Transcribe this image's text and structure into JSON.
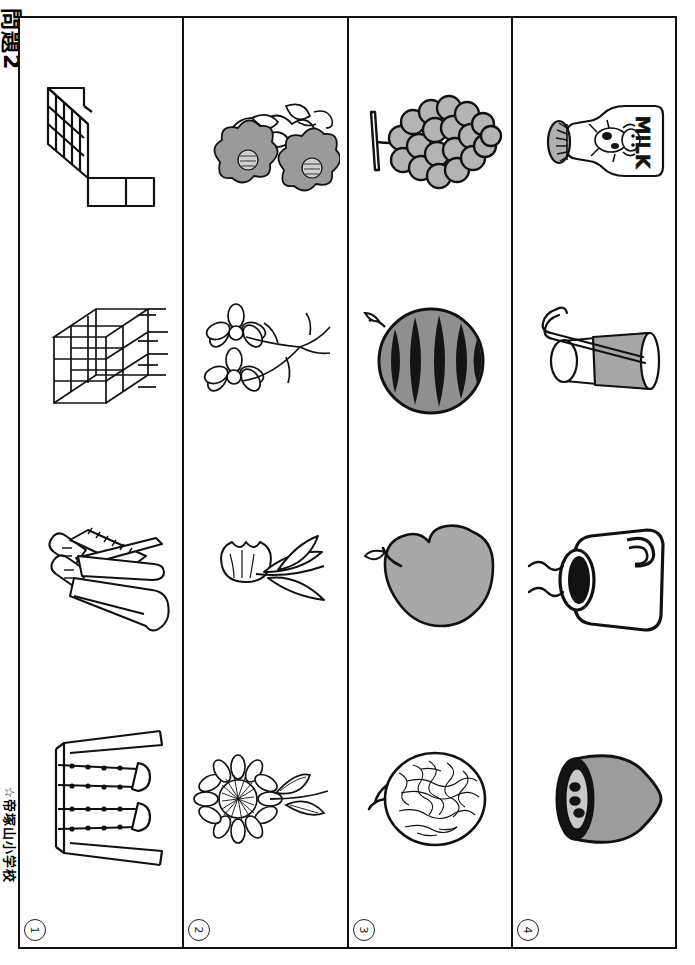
{
  "sheet": {
    "title": "問題2",
    "school": "☆帝塚山小学校",
    "orientation": "landscape-worksheet-rotated-90",
    "ink_color": "#111111",
    "fill_gray": "#9a9a9a",
    "paper_color": "#ffffff"
  },
  "columns": [
    {
      "number": "1",
      "number_glyph": "①",
      "theme": "playground-equipment",
      "items": [
        {
          "name": "stairs-slide-frame",
          "label": "すべり台の階段",
          "icon": "stairs-icon"
        },
        {
          "name": "jungle-gym",
          "label": "ジャングルジム",
          "icon": "jungle-gym-icon"
        },
        {
          "name": "slide",
          "label": "すべり台",
          "icon": "slide-icon"
        },
        {
          "name": "swing-set",
          "label": "ブランコ",
          "icon": "swing-icon"
        }
      ]
    },
    {
      "number": "2",
      "number_glyph": "②",
      "theme": "flowers",
      "items": [
        {
          "name": "camellia-flowers",
          "label": "つばき",
          "icon": "camellia-icon"
        },
        {
          "name": "cosmos-flowers",
          "label": "コスモス",
          "icon": "daisy-icon"
        },
        {
          "name": "tulip-flower",
          "label": "チューリップ",
          "icon": "tulip-icon"
        },
        {
          "name": "sunflower",
          "label": "ひまわり",
          "icon": "sunflower-icon"
        }
      ]
    },
    {
      "number": "3",
      "number_glyph": "③",
      "theme": "fruits",
      "items": [
        {
          "name": "grapes",
          "label": "ぶどう",
          "icon": "grapes-icon"
        },
        {
          "name": "watermelon",
          "label": "すいか",
          "icon": "watermelon-icon"
        },
        {
          "name": "apple",
          "label": "りんご",
          "icon": "apple-icon"
        },
        {
          "name": "melon",
          "label": "メロン",
          "icon": "melon-icon"
        }
      ]
    },
    {
      "number": "4",
      "number_glyph": "④",
      "theme": "drinks",
      "items": [
        {
          "name": "milk-bottle",
          "label": "ぎゅうにゅう",
          "icon": "milk-bottle-icon",
          "text_on_bottle": "MILK"
        },
        {
          "name": "juice-glass",
          "label": "ジュース",
          "icon": "glass-straw-icon"
        },
        {
          "name": "coffee-cup",
          "label": "コーヒー",
          "icon": "mug-icon"
        },
        {
          "name": "soup-bowl",
          "label": "スープ",
          "icon": "bowl-icon"
        }
      ]
    }
  ]
}
